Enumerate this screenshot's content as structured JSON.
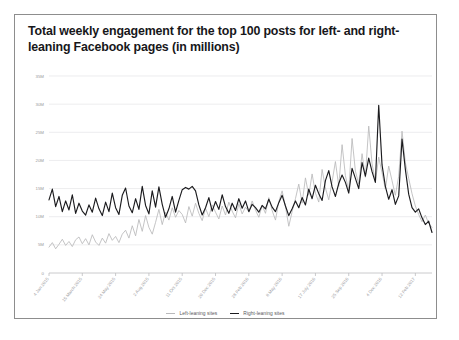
{
  "card": {
    "title": "Total weekly engagement for the top 100 posts for left- and right-leaning Facebook pages (in millions)"
  },
  "legend": {
    "items": [
      {
        "label": "Left-leaning sites",
        "color": "#b9b9bb",
        "key": "left"
      },
      {
        "label": "Right-leaning sites",
        "color": "#1b1b1e",
        "key": "right"
      }
    ]
  },
  "chart_data": {
    "type": "line",
    "title": "Total weekly engagement for the top 100 posts for left- and right-leaning Facebook pages (in millions)",
    "xlabel": "",
    "ylabel": "",
    "ylim": [
      0,
      35
    ],
    "yticks": [
      0,
      5,
      10,
      15,
      20,
      25,
      30,
      35
    ],
    "ytick_labels": [
      "0",
      "5M",
      "10M",
      "15M",
      "20M",
      "25M",
      "30M",
      "35M"
    ],
    "grid": true,
    "legend_position": "bottom",
    "units": "millions of engagements per week",
    "xtick_labels": [
      "4 Jan 2015",
      "15 March 2015",
      "24 May 2015",
      "2 Aug 2015",
      "11 Oct 2015",
      "20 Dec 2015",
      "28 Feb 2016",
      "8 May 2016",
      "17 July 2016",
      "25 Sep 2016",
      "4 Dec 2016",
      "12 Feb 2017"
    ],
    "xtick_indices": [
      0,
      10,
      20,
      30,
      40,
      50,
      60,
      70,
      80,
      90,
      100,
      110
    ],
    "series": [
      {
        "name": "Left-leaning sites",
        "color": "#b9b9bb",
        "values": [
          4.6,
          5.4,
          4.3,
          5.1,
          6.0,
          4.9,
          5.6,
          4.7,
          5.9,
          6.4,
          5.2,
          6.1,
          5.0,
          6.8,
          5.5,
          4.9,
          6.2,
          5.3,
          7.0,
          5.8,
          6.5,
          5.4,
          6.9,
          7.6,
          6.2,
          8.4,
          6.6,
          9.5,
          7.4,
          10.2,
          8.1,
          6.9,
          9.0,
          11.3,
          8.6,
          10.8,
          9.4,
          11.6,
          9.9,
          11.1,
          10.4,
          8.9,
          11.8,
          10.1,
          12.4,
          10.6,
          9.3,
          11.5,
          10.0,
          12.1,
          10.8,
          9.6,
          11.9,
          10.3,
          12.6,
          11.0,
          9.8,
          12.3,
          10.5,
          11.7,
          10.9,
          12.8,
          11.2,
          9.9,
          12.0,
          10.6,
          13.4,
          11.1,
          9.4,
          12.7,
          14.6,
          11.8,
          8.3,
          10.9,
          13.2,
          15.8,
          12.4,
          16.9,
          13.8,
          17.6,
          14.2,
          12.6,
          18.4,
          15.1,
          13.0,
          16.2,
          19.8,
          15.4,
          22.8,
          17.3,
          14.6,
          23.9,
          18.1,
          15.8,
          21.2,
          17.0,
          26.1,
          19.4,
          16.2,
          20.6,
          17.8,
          14.9,
          19.0,
          16.4,
          13.8,
          17.2,
          25.2,
          19.6,
          16.8,
          14.1,
          11.9,
          10.4,
          9.1,
          10.3,
          8.8,
          8.1
        ]
      },
      {
        "name": "Right-leaning sites",
        "color": "#1b1b1e",
        "values": [
          13.0,
          14.9,
          11.8,
          13.6,
          10.9,
          12.8,
          11.2,
          13.9,
          10.6,
          12.4,
          11.0,
          10.3,
          12.1,
          10.8,
          13.3,
          11.4,
          10.2,
          12.6,
          10.9,
          14.2,
          11.6,
          10.4,
          13.8,
          15.1,
          11.9,
          10.7,
          13.2,
          11.3,
          15.4,
          12.0,
          10.5,
          14.6,
          11.7,
          15.3,
          12.2,
          9.9,
          11.4,
          13.6,
          10.8,
          12.9,
          14.8,
          15.2,
          14.9,
          15.4,
          14.6,
          12.1,
          10.3,
          11.6,
          13.4,
          11.0,
          12.7,
          11.3,
          13.9,
          11.8,
          10.6,
          12.4,
          11.1,
          13.2,
          11.5,
          12.8,
          10.9,
          12.2,
          11.6,
          10.8,
          12.0,
          11.4,
          13.1,
          11.7,
          10.9,
          12.5,
          13.8,
          11.9,
          10.2,
          11.4,
          12.8,
          11.6,
          13.4,
          12.1,
          14.9,
          13.2,
          15.6,
          14.1,
          12.9,
          16.4,
          18.2,
          15.3,
          13.6,
          15.9,
          17.4,
          16.1,
          14.2,
          18.6,
          16.8,
          15.0,
          19.6,
          17.2,
          20.4,
          18.0,
          16.1,
          29.8,
          19.2,
          15.4,
          13.1,
          14.8,
          12.2,
          13.7,
          23.8,
          18.4,
          14.0,
          11.6,
          10.8,
          11.4,
          9.8,
          8.6,
          9.2,
          7.2
        ]
      }
    ]
  }
}
